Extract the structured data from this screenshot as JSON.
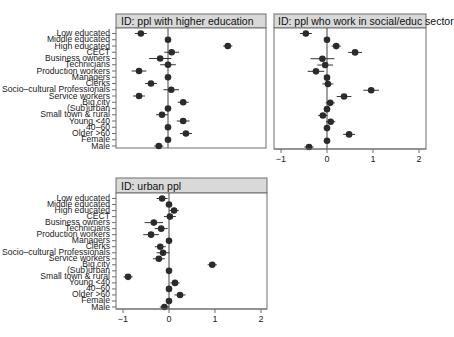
{
  "chart_data": [
    {
      "type": "scatter",
      "subtype": "coefficient-plot-with-error-bars",
      "title": "ID: ppl with higher education",
      "xlabel": "",
      "ylabel": "",
      "xlim": [
        -1.1,
        2.1
      ],
      "xticks": [],
      "show_x_axis": false,
      "grid": false,
      "reference_line": 0,
      "categories": [
        "Low educated",
        "Middle educated",
        "High educated",
        "CECT",
        "Business owners",
        "Technicians",
        "Production workers",
        "Managers",
        "Clerks",
        "Socio–cultural Professionals",
        "Service workers",
        "Big city",
        "(Sub)urban",
        "Small town & rural",
        "Young <40",
        "40–60",
        "Older >60",
        "Female",
        "Male"
      ],
      "values": [
        -0.59,
        0,
        1.3,
        0.08,
        -0.17,
        0,
        -0.63,
        0,
        -0.37,
        0.07,
        -0.63,
        0.33,
        0,
        -0.13,
        0.33,
        0,
        0.39,
        0,
        -0.2
      ],
      "errors": [
        0.13,
        0,
        0.1,
        0.16,
        0.24,
        0.17,
        0.16,
        0,
        0.13,
        0.17,
        0.13,
        0.12,
        0,
        0.13,
        0.14,
        0,
        0.13,
        0,
        0.1
      ]
    },
    {
      "type": "scatter",
      "subtype": "coefficient-plot-with-error-bars",
      "title": "ID: ppl who work in social/educ sector",
      "xlabel": "",
      "ylabel": "",
      "xlim": [
        -1.1,
        2.1
      ],
      "xticks": [
        "-1",
        "0",
        "1",
        "2"
      ],
      "show_x_axis": true,
      "grid": false,
      "reference_line": 0,
      "categories": [
        "Low educated",
        "Middle educated",
        "High educated",
        "CECT",
        "Business owners",
        "Technicians",
        "Production workers",
        "Managers",
        "Clerks",
        "Socio–cultural Professionals",
        "Service workers",
        "Big city",
        "(Sub)urban",
        "Small town & rural",
        "Young <40",
        "40–60",
        "Older >60",
        "Female",
        "Male"
      ],
      "values": [
        -0.46,
        0,
        0.2,
        0.61,
        -0.1,
        -0.04,
        -0.24,
        0,
        0.02,
        0.96,
        0.37,
        0.07,
        0,
        -0.09,
        0.08,
        0,
        0.48,
        0,
        -0.39
      ],
      "errors": [
        0.13,
        0,
        0.1,
        0.15,
        0.26,
        0.17,
        0.18,
        0,
        0.12,
        0.17,
        0.16,
        0.1,
        0,
        0.1,
        0.1,
        0,
        0.13,
        0,
        0.1
      ]
    },
    {
      "type": "scatter",
      "subtype": "coefficient-plot-with-error-bars",
      "title": "ID: urban ppl",
      "xlabel": "",
      "ylabel": "",
      "xlim": [
        -1.1,
        2.1
      ],
      "xticks": [
        "-1",
        "0",
        "1",
        "2"
      ],
      "show_x_axis": true,
      "grid": false,
      "reference_line": 0,
      "categories": [
        "Low educated",
        "Middle educated",
        "High educated",
        "CECT",
        "Business owners",
        "Technicians",
        "Production workers",
        "Managers",
        "Clerks",
        "Socio–cultural Professionals",
        "Service workers",
        "Big city",
        "(Sub)urban",
        "Small town & rural",
        "Young <40",
        "40–60",
        "Older >60",
        "Female",
        "Male"
      ],
      "values": [
        -0.15,
        0,
        0.11,
        0.02,
        -0.33,
        -0.17,
        -0.39,
        0,
        -0.19,
        -0.13,
        -0.22,
        0.94,
        0,
        -0.89,
        0.13,
        0,
        0.24,
        0,
        -0.1
      ],
      "errors": [
        0.12,
        0,
        0.1,
        0.13,
        0.2,
        0.14,
        0.17,
        0,
        0.12,
        0.14,
        0.13,
        0.1,
        0,
        0.1,
        0.1,
        0,
        0.12,
        0,
        0.1
      ]
    }
  ],
  "panels": [
    {
      "title": "ID: ppl with higher education"
    },
    {
      "title": "ID: ppl who work in social/educ sector"
    },
    {
      "title": "ID: urban ppl"
    }
  ],
  "colors": {
    "point": "#2b2b2b",
    "errorbar": "#333333",
    "frame": "#6e6e6e",
    "strip_bg": "#d9d9d9",
    "zero_line": "#444444"
  }
}
